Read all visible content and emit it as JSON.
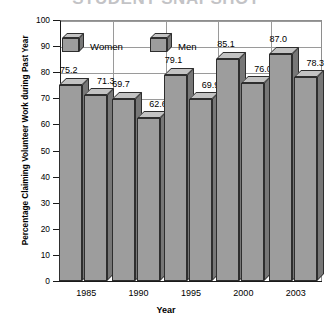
{
  "chart_data": {
    "type": "bar",
    "title": "STUDENT SNAPSHOT",
    "xlabel": "Year",
    "ylabel": "Percentage Claiming Volunteer Work during Past Year",
    "categories": [
      "1985",
      "1990",
      "1995",
      "2000",
      "2003"
    ],
    "ylim": [
      0,
      100
    ],
    "yticks": [
      "0",
      "10",
      "20",
      "30",
      "40",
      "50",
      "60",
      "70",
      "80",
      "90",
      "100"
    ],
    "grid": true,
    "legend_position": "inside-top-left",
    "series": [
      {
        "name": "Women",
        "values": [
          75.2,
          69.7,
          79.1,
          85.1,
          87.0
        ]
      },
      {
        "name": "Men",
        "values": [
          71.3,
          62.6,
          69.9,
          76.0,
          78.3
        ]
      }
    ],
    "colors": {
      "bar_front": "#9d9d9d",
      "bar_top": "#c3c3c3",
      "bar_side": "#777777",
      "outline": "#2e2e2e",
      "grid": "#9a9a9a",
      "axis": "#1a1a1a",
      "text": "#000000"
    }
  }
}
